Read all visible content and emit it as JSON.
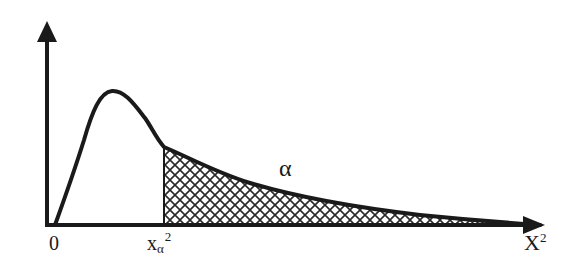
{
  "diagram": {
    "colors": {
      "stroke": "#1a1a1a",
      "background": "#ffffff",
      "hatch": "#2a2a2a"
    },
    "labels": {
      "origin": "0",
      "critical_base": "x",
      "critical_sub": "α",
      "critical_sup": "2",
      "tail_area": "α",
      "x_axis_base": "X",
      "x_axis_sup": "2"
    },
    "shapes": {
      "y_axis": {
        "x": 47,
        "y_top": 22,
        "y_bottom": 226,
        "arrow": "up"
      },
      "x_axis": {
        "y": 225,
        "x_left": 47,
        "x_right": 545,
        "arrow": "right"
      },
      "curve": "right-skewed density, starts at 0, peaks near x=110, long right tail",
      "critical_line_x": 164,
      "shaded_region": "cross-hatched area right of critical value under curve"
    }
  }
}
